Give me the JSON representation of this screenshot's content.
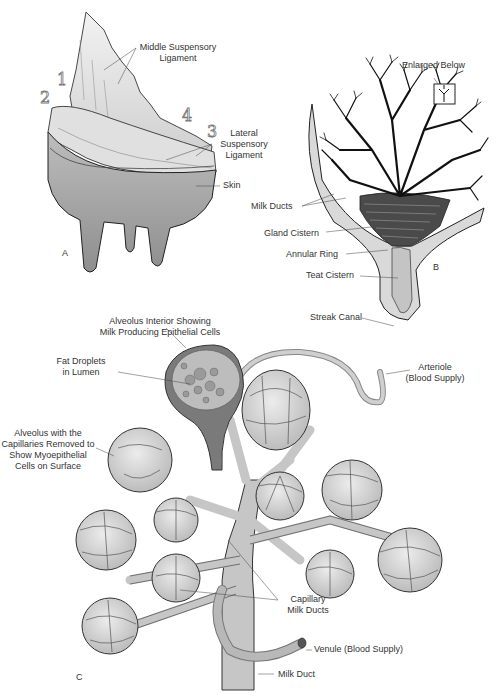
{
  "figure": {
    "panels": [
      {
        "id": "A",
        "label": "A",
        "callouts": [
          {
            "key": "middle_ligament",
            "text_lines": [
              "Middle Suspensory",
              "Ligament"
            ]
          },
          {
            "key": "lateral_ligament",
            "text_lines": [
              "Lateral",
              "Suspensory",
              "Ligament"
            ]
          },
          {
            "key": "skin",
            "text_lines": [
              "Skin"
            ]
          }
        ],
        "numbers": [
          "1",
          "2",
          "3",
          "4"
        ]
      },
      {
        "id": "B",
        "label": "B",
        "callouts": [
          {
            "key": "enlarged",
            "text_lines": [
              "Enlarged Below"
            ]
          },
          {
            "key": "milk_ducts",
            "text_lines": [
              "Milk Ducts"
            ]
          },
          {
            "key": "gland_cistern",
            "text_lines": [
              "Gland Cistern"
            ]
          },
          {
            "key": "annular_ring",
            "text_lines": [
              "Annular Ring"
            ]
          },
          {
            "key": "teat_cistern",
            "text_lines": [
              "Teat Cistern"
            ]
          },
          {
            "key": "streak_canal",
            "text_lines": [
              "Streak Canal"
            ]
          }
        ]
      },
      {
        "id": "C",
        "label": "C",
        "callouts": [
          {
            "key": "alveolus_interior",
            "text_lines": [
              "Alveolus Interior Showing",
              "Milk Producing Epithelial Cells"
            ]
          },
          {
            "key": "fat_droplets",
            "text_lines": [
              "Fat Droplets",
              "in Lumen"
            ]
          },
          {
            "key": "alveolus_removed",
            "text_lines": [
              "Alveolus with the",
              "Capillaries Removed to",
              "Show Myoepithelial",
              "Cells on Surface"
            ]
          },
          {
            "key": "arteriole",
            "text_lines": [
              "Arteriole",
              "(Blood Supply)"
            ]
          },
          {
            "key": "capillary",
            "text_lines": [
              "Capillary",
              "Milk Ducts"
            ]
          },
          {
            "key": "venule",
            "text_lines": [
              "Venule (Blood Supply)"
            ]
          },
          {
            "key": "milk_duct",
            "text_lines": [
              "Milk Duct"
            ]
          }
        ]
      }
    ]
  },
  "labels": {
    "panel_a": "A",
    "panel_b": "B",
    "panel_c": "C",
    "middle_ligament_1": "Middle Suspensory",
    "middle_ligament_2": "Ligament",
    "lateral_1": "Lateral",
    "lateral_2": "Suspensory",
    "lateral_3": "Ligament",
    "skin": "Skin",
    "n1": "1",
    "n2": "2",
    "n3": "3",
    "n4": "4",
    "enlarged": "Enlarged Below",
    "milk_ducts": "Milk Ducts",
    "gland_cistern": "Gland Cistern",
    "annular_ring": "Annular Ring",
    "teat_cistern": "Teat Cistern",
    "streak_canal": "Streak Canal",
    "alv_int_1": "Alveolus Interior Showing",
    "alv_int_2": "Milk Producing Epithelial Cells",
    "fat_1": "Fat Droplets",
    "fat_2": "in Lumen",
    "alv_rm_1": "Alveolus with the",
    "alv_rm_2": "Capillaries Removed to",
    "alv_rm_3": "Show Myoepithelial",
    "alv_rm_4": "Cells on Surface",
    "arteriole_1": "Arteriole",
    "arteriole_2": "(Blood Supply)",
    "capillary_1": "Capillary",
    "capillary_2": "Milk Ducts",
    "venule": "Venule (Blood Supply)",
    "milk_duct": "Milk Duct"
  },
  "colors": {
    "line": "#222222",
    "tissue_light": "#e6e6e6",
    "tissue_mid": "#c8c8c8",
    "tissue_dark": "#9a9a9a",
    "label_text": "#333333"
  }
}
